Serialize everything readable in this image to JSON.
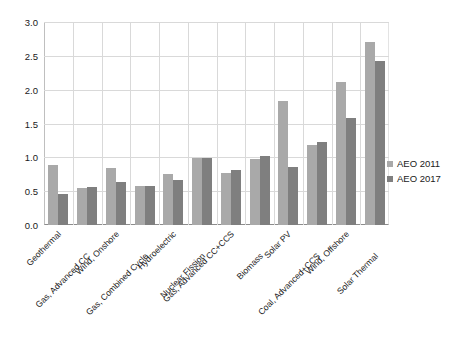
{
  "chart_data": {
    "type": "bar",
    "title": "",
    "subtitle": "",
    "xlabel": "",
    "ylabel": "",
    "ylim": [
      0.0,
      3.0
    ],
    "ytick_labels": [
      "0.0",
      "0.5",
      "1.0",
      "1.5",
      "2.0",
      "2.5",
      "3.0"
    ],
    "ytick_values": [
      0.0,
      0.5,
      1.0,
      1.5,
      2.0,
      2.5,
      3.0
    ],
    "grid": "horizontal-and-vertical",
    "legend_position": "right-middle",
    "categories": [
      "Geothermal",
      "Gas, Advanced CC",
      "Wind, Onshore",
      "Gas, Combined Cycle",
      "Hydroelectric",
      "Nuclear Fission",
      "Gas, Advanced CC+CCS",
      "Biomass",
      "Solar PV",
      "Coal, Advanced+CCS",
      "Wind, Offshore",
      "Solar Thermal"
    ],
    "series": [
      {
        "name": "AEO 2011",
        "color": "#a9a9a9",
        "values": [
          0.89,
          0.55,
          0.84,
          0.57,
          0.75,
          0.99,
          0.77,
          0.98,
          1.83,
          1.18,
          2.11,
          2.71
        ]
      },
      {
        "name": "AEO 2017",
        "color": "#7f7f7f",
        "values": [
          0.46,
          0.56,
          0.64,
          0.57,
          0.66,
          0.99,
          0.82,
          1.02,
          0.85,
          1.23,
          1.58,
          2.42
        ]
      }
    ]
  },
  "legend": {
    "items": [
      {
        "label": "AEO 2011",
        "swatch": "legend-swatch-2011"
      },
      {
        "label": "AEO 2017",
        "swatch": "legend-swatch-2017"
      }
    ]
  }
}
